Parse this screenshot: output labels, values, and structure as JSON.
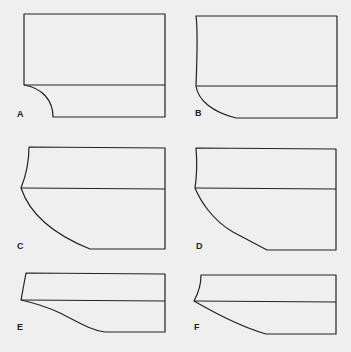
{
  "panels": [
    {
      "label": "A"
    },
    {
      "label": "B"
    },
    {
      "label": "C"
    },
    {
      "label": "D"
    },
    {
      "label": "E"
    },
    {
      "label": "F"
    }
  ],
  "colors": {
    "background": "#efefef",
    "stroke": "#222222"
  }
}
